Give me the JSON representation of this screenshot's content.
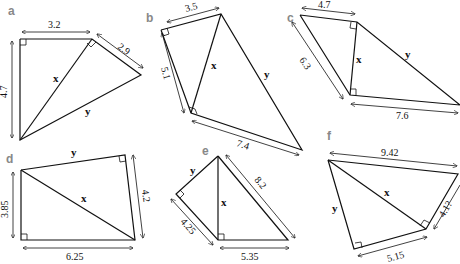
{
  "figures": [
    {
      "label": "a",
      "lengths": [
        "3.2",
        "2.9",
        "4.7"
      ],
      "unknowns": [
        "x",
        "y"
      ]
    },
    {
      "label": "b",
      "lengths": [
        "3.5",
        "5.1",
        "7.4"
      ],
      "unknowns": [
        "x",
        "y"
      ]
    },
    {
      "label": "c",
      "lengths": [
        "4.7",
        "6.3",
        "7.6"
      ],
      "unknowns": [
        "x",
        "y"
      ]
    },
    {
      "label": "d",
      "lengths": [
        "3.85",
        "4.2",
        "6.25"
      ],
      "unknowns": [
        "x",
        "y"
      ]
    },
    {
      "label": "e",
      "lengths": [
        "8.2",
        "4.25",
        "5.35"
      ],
      "unknowns": [
        "x",
        "y"
      ]
    },
    {
      "label": "f",
      "lengths": [
        "9.42",
        "4.1?",
        "5.15"
      ],
      "unknowns": [
        "x",
        "y"
      ]
    }
  ]
}
